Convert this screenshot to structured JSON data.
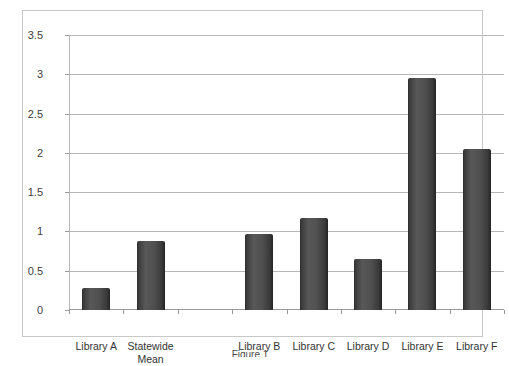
{
  "chart_data": {
    "type": "bar",
    "title": "",
    "xlabel": "",
    "ylabel": "",
    "ylim": [
      0,
      3.5
    ],
    "ytick_values": [
      0,
      0.5,
      1,
      1.5,
      2,
      2.5,
      3,
      3.5
    ],
    "ytick_labels": [
      "0",
      "0.5",
      "1",
      "1.5",
      "2",
      "2.5",
      "3",
      "3.5"
    ],
    "grid": true,
    "legend": false,
    "bar_color": "#4a4a4a",
    "categories": [
      "Library A",
      "Statewide Mean",
      "",
      "Library B",
      "Library C",
      "Library D",
      "Library E",
      "Library F"
    ],
    "bars": [
      {
        "label": "Library A",
        "label_line1": "Library A",
        "label_line2": "",
        "value": 0.28
      },
      {
        "label": "Statewide Mean",
        "label_line1": "Statewide",
        "label_line2": "Mean",
        "value": 0.88
      },
      {
        "label": "",
        "label_line1": "",
        "label_line2": "",
        "value": 0
      },
      {
        "label": "Library B",
        "label_line1": "Library B",
        "label_line2": "",
        "value": 0.97
      },
      {
        "label": "Library C",
        "label_line1": "Library C",
        "label_line2": "",
        "value": 1.17
      },
      {
        "label": "Library D",
        "label_line1": "Library D",
        "label_line2": "",
        "value": 0.65
      },
      {
        "label": "Library E",
        "label_line1": "Library E",
        "label_line2": "",
        "value": 2.95
      },
      {
        "label": "Library F",
        "label_line1": "Library F",
        "label_line2": "",
        "value": 2.05
      }
    ]
  },
  "caption": {
    "text": "Figure 1"
  }
}
